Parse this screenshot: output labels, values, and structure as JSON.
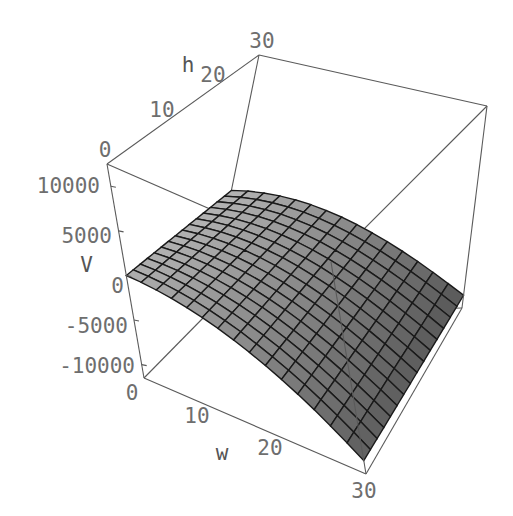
{
  "chart_data": {
    "type": "surface3d",
    "title": "",
    "xlabel": "w",
    "ylabel": "h",
    "zlabel": "V",
    "x_ticks": [
      0,
      10,
      20,
      30
    ],
    "y_ticks": [
      0,
      10,
      20,
      30
    ],
    "z_ticks": [
      -10000,
      -5000,
      0,
      5000,
      10000
    ],
    "xlim": [
      0,
      30
    ],
    "ylim": [
      0,
      30
    ],
    "zlim": [
      -11500,
      12500
    ],
    "mesh_divisions": 15,
    "function_description": "V(w,h) approx 1.9*h*w*(30-w)/30*30/30 - 11.1*w^2 ; saddle-like ridge peaking near w~14, h=30",
    "sample_values": {
      "V(0,0)": 0,
      "V(30,0)": -10000,
      "V(30,30)": -10000,
      "V(14,30)": 10600
    },
    "grid": false,
    "box": true,
    "colors": {
      "surface_light": "#e6e6e6",
      "surface_dark": "#2b2b2b",
      "box": "#5a5a5a",
      "text": "#6e6e6e"
    }
  },
  "labels": {
    "w": "w",
    "h": "h",
    "V": "V",
    "w_ticks": [
      "0",
      "10",
      "20",
      "30"
    ],
    "h_ticks": [
      "0",
      "10",
      "20",
      "30"
    ],
    "V_ticks": [
      "10000",
      "5000",
      "0",
      "-5000",
      "-10000"
    ]
  }
}
